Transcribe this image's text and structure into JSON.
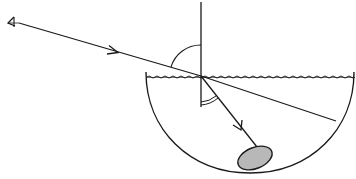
{
  "diagram": {
    "title": "Refraction of light: viewing a stone in a bowl of water",
    "colors": {
      "background": "#ffffff",
      "stroke": "#1a1a1a",
      "stone_fill": "#b8b8b8"
    },
    "elements": {
      "eye": {
        "label": "",
        "icon": "eye-icon",
        "x": 12,
        "y": 22
      },
      "incident_ray": {
        "from": [
          18,
          23
        ],
        "to": [
          201,
          76
        ],
        "arrow_at": [
          115,
          52
        ]
      },
      "normal": {
        "x": 201,
        "y_top": 2,
        "y_bottom": 107
      },
      "water_surface": {
        "y": 77,
        "x_start": 146,
        "x_end": 353
      },
      "bowl": {
        "left": [
          146,
          72
        ],
        "right": [
          354,
          72
        ],
        "bottom": [
          250,
          172
        ]
      },
      "apparent_ray_extension": {
        "from": [
          201,
          76
        ],
        "to": [
          336,
          121
        ]
      },
      "refracted_ray": {
        "from": [
          201,
          76
        ],
        "to": [
          256,
          146
        ],
        "arrow_at": [
          240,
          127
        ]
      },
      "stone": {
        "cx": 255,
        "cy": 158,
        "rx": 18,
        "ry": 10,
        "rotation": -22
      },
      "angle_incidence_arc": {
        "type": "single"
      },
      "angle_refraction_arc": {
        "type": "double"
      }
    }
  }
}
